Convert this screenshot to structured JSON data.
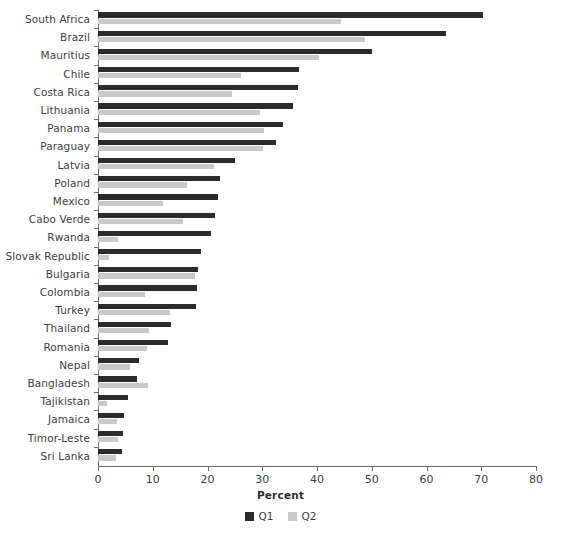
{
  "chart_data": {
    "type": "bar",
    "orientation": "horizontal",
    "title": "",
    "xlabel": "Percent",
    "ylabel": "",
    "xlim": [
      0,
      80
    ],
    "xticks": [
      0,
      10,
      20,
      30,
      40,
      50,
      60,
      70,
      80
    ],
    "grid": false,
    "legend_position": "bottom-center",
    "categories": [
      "South Africa",
      "Brazil",
      "Mauritius",
      "Chile",
      "Costa Rica",
      "Lithuania",
      "Panama",
      "Paraguay",
      "Latvia",
      "Poland",
      "Mexico",
      "Cabo Verde",
      "Rwanda",
      "Slovak Republic",
      "Bulgaria",
      "Colombia",
      "Turkey",
      "Thailand",
      "Romania",
      "Nepal",
      "Bangladesh",
      "Tajikistan",
      "Jamaica",
      "Timor-Leste",
      "Sri Lanka"
    ],
    "series": [
      {
        "name": "Q1",
        "color": "#2b2b2b",
        "values": [
          70.3,
          63.5,
          50.1,
          36.8,
          36.6,
          35.6,
          33.7,
          32.5,
          25.0,
          22.2,
          21.9,
          21.4,
          20.6,
          18.9,
          18.3,
          18.0,
          17.9,
          13.3,
          12.7,
          7.5,
          7.2,
          5.4,
          4.8,
          4.6,
          4.3
        ]
      },
      {
        "name": "Q2",
        "color": "#c9c9c9",
        "values": [
          44.4,
          48.7,
          40.4,
          26.1,
          24.5,
          29.5,
          30.4,
          30.1,
          21.1,
          16.2,
          11.9,
          15.5,
          3.6,
          2.0,
          17.7,
          8.5,
          13.2,
          9.4,
          8.9,
          5.8,
          9.2,
          1.6,
          3.4,
          3.6,
          3.2
        ]
      }
    ]
  },
  "legend": {
    "items": [
      {
        "label": "Q1",
        "color": "#2b2b2b"
      },
      {
        "label": "Q2",
        "color": "#c9c9c9"
      }
    ]
  }
}
